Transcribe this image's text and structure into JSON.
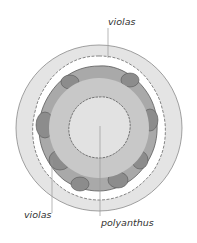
{
  "diagram": {
    "type": "circular planting plan",
    "labels": {
      "top": "violas",
      "left": "violas",
      "center": "polyanthus"
    },
    "colors": {
      "outer_ring": "#dcdcdc",
      "gap": "#ffffff",
      "flower_clumps": "#a8a8a8",
      "flower_clumps_dark": "#8a8a8a",
      "middle_ring": "#c8c8c8",
      "center": "#e2e2e2",
      "outline": "#6a6a6a",
      "leader_line": "#9a9a9a"
    }
  }
}
